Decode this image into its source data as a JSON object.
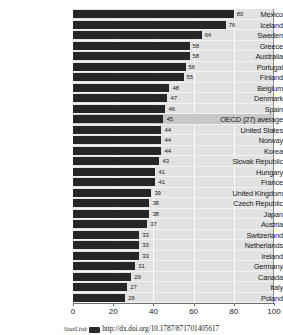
{
  "chart_data": {
    "type": "bar",
    "orientation": "horizontal",
    "title": "",
    "subtitle": "",
    "xlabel": "",
    "ylabel": "",
    "xlim": [
      0,
      100
    ],
    "xticks": [
      0,
      20,
      40,
      60,
      80,
      100
    ],
    "xtick_labels": [
      "0",
      "20",
      "40",
      "60",
      "80",
      "100"
    ],
    "grid": true,
    "grid_axis": "x",
    "legend": false,
    "legend_position": "none",
    "bar_color": "#262626",
    "plot_background": "#e2e2e2",
    "gridline_color": "#fdfdfd",
    "highlight_row_color": "#c8c8c8",
    "highlight_category": "OECD (27) average",
    "show_value_labels": true,
    "categories": [
      "Mexico",
      "Iceland",
      "Sweden",
      "Greece",
      "Australia",
      "Portugal",
      "Finland",
      "Belgium",
      "Denmark",
      "Spain",
      "OECD (27) average",
      "United States",
      "Norway",
      "Korea",
      "Slovak Republic",
      "Hungary",
      "France",
      "United Kingdom",
      "Czech Republic",
      "Japan",
      "Austria",
      "Switzerland",
      "Netherlands",
      "Ireland",
      "Germany",
      "Canada",
      "Italy",
      "Poland"
    ],
    "values": [
      80,
      76,
      64,
      58,
      58,
      56,
      55,
      48,
      47,
      46,
      45,
      44,
      44,
      44,
      43,
      41,
      41,
      39,
      38,
      38,
      37,
      33,
      33,
      33,
      31,
      29,
      27,
      26
    ],
    "value_labels": [
      "80",
      "76",
      "64",
      "58",
      "58",
      "56",
      "55",
      "48",
      "47",
      "46",
      "45",
      "44",
      "44",
      "44",
      "43",
      "41",
      "41",
      "39",
      "38",
      "38",
      "37",
      "33",
      "33",
      "33",
      "31",
      "29",
      "27",
      "26"
    ]
  },
  "footer": {
    "statlink_label": "StatLink",
    "statlink_glyph": "statlink-barcode-icon",
    "statlink_url": "http://dx.doi.org/10.1787/871701405617"
  }
}
